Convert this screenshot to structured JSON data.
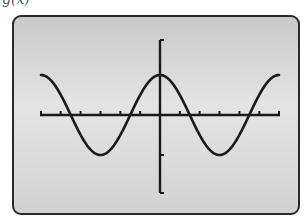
{
  "caption_fragment": "g(x)",
  "colors": {
    "screen_bg_top": "#c9c9c9",
    "screen_bg_mid": "#e4e4e4",
    "ink": "#1a1a1a",
    "frame": "#2a2a2a"
  },
  "chart_data": {
    "type": "line",
    "title": "",
    "function_label": "g(x)",
    "xlabel": "",
    "ylabel": "",
    "xlim": [
      -6.28,
      6.28
    ],
    "ylim": [
      -2,
      2
    ],
    "x_tick_step": 1.047,
    "x_ticks": [
      -6.28,
      -5.24,
      -4.19,
      -3.14,
      -2.09,
      -1.05,
      0,
      1.05,
      2.09,
      3.14,
      4.19,
      5.24,
      6.28
    ],
    "y_ticks": [
      -2,
      -1,
      1,
      2
    ],
    "grid": false,
    "legend": null,
    "series": [
      {
        "name": "g(x)",
        "x": [
          -6.28,
          -5.5,
          -4.71,
          -3.93,
          -3.14,
          -2.36,
          -1.57,
          -0.79,
          0,
          0.79,
          1.57,
          2.36,
          3.14,
          3.93,
          4.71,
          5.5,
          6.28
        ],
        "values": [
          1,
          0.71,
          0,
          -0.71,
          -1,
          -0.71,
          0,
          0.71,
          1,
          0.71,
          0,
          -0.71,
          -1,
          -0.71,
          0,
          0.71,
          1
        ]
      }
    ],
    "features": {
      "maxima": [
        [
          -6.28,
          1
        ],
        [
          0,
          1
        ],
        [
          6.28,
          1
        ]
      ],
      "minima": [
        [
          -3.14,
          -1
        ],
        [
          3.14,
          -1
        ]
      ],
      "zeros": [
        -4.71,
        -1.57,
        1.57,
        4.71
      ],
      "amplitude": 1,
      "period": 6.28
    }
  }
}
